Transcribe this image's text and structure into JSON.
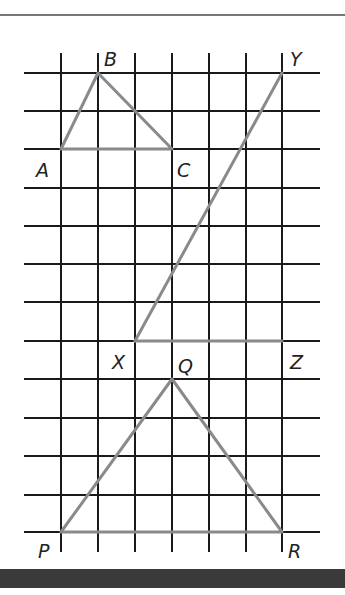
{
  "diagram": {
    "type": "grid-figures",
    "grid": {
      "rows_y": [
        73,
        111,
        149,
        188,
        226,
        264,
        302,
        341,
        379,
        418,
        456,
        495,
        532
      ],
      "cols_x": [
        61,
        98,
        135,
        172,
        209,
        246,
        282
      ],
      "h_line_x_range": [
        24,
        320
      ],
      "v_line_y_range": [
        53,
        552
      ],
      "line_color": "#1a1a1a",
      "figure_color": "#8a8a8a"
    },
    "figures": [
      {
        "name": "triangle-ABC",
        "points": {
          "A": [
            61,
            149
          ],
          "B": [
            98,
            73
          ],
          "C": [
            172,
            149
          ]
        },
        "closed": true
      },
      {
        "name": "triangle-XYZ",
        "points": {
          "X": [
            135,
            341
          ],
          "Y": [
            282,
            73
          ],
          "Z": [
            282,
            341
          ]
        },
        "closed": false,
        "segments": [
          [
            "X",
            "Y"
          ],
          [
            "X",
            "Z"
          ]
        ]
      },
      {
        "name": "triangle-PQR",
        "points": {
          "P": [
            61,
            532
          ],
          "Q": [
            172,
            379
          ],
          "R": [
            282,
            532
          ]
        },
        "closed": true
      }
    ],
    "labels": {
      "A": "A",
      "B": "B",
      "C": "C",
      "X": "X",
      "Y": "Y",
      "Z": "Z",
      "P": "P",
      "Q": "Q",
      "R": "R"
    }
  }
}
